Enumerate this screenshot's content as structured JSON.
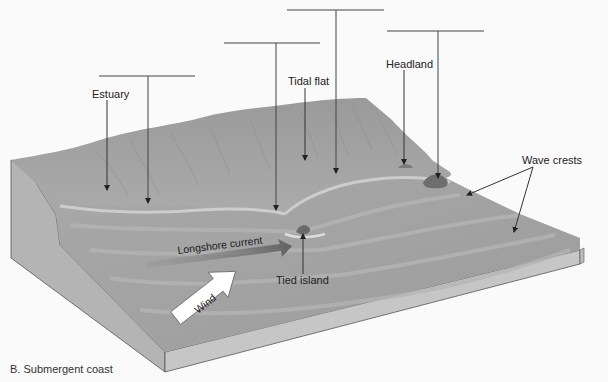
{
  "figure": {
    "caption": "B. Submergent coast"
  },
  "labels": {
    "estuary": "Estuary",
    "tidal_flat": "Tidal flat",
    "headland": "Headland",
    "wave_crests": "Wave crests",
    "tied_island": "Tied island",
    "longshore_current": "Longshore current",
    "wind": "Wind"
  },
  "blank_label_bars": [
    {
      "id": "bar-1",
      "x1": 99,
      "x2": 195,
      "y": 76,
      "stem_x": 148,
      "stem_end_y": 205
    },
    {
      "id": "bar-2",
      "x1": 224,
      "x2": 320,
      "y": 43,
      "stem_x": 276,
      "stem_end_y": 212
    },
    {
      "id": "bar-3",
      "x1": 287,
      "x2": 384,
      "y": 10,
      "stem_x": 336,
      "stem_end_y": 175
    },
    {
      "id": "bar-4",
      "x1": 387,
      "x2": 484,
      "y": 31,
      "stem_x": 438,
      "stem_end_y": 180
    }
  ],
  "colors": {
    "background": "#fafafa",
    "land": "#a6a6a6",
    "land_dark": "#8e8e8e",
    "water": "#9d9d9d",
    "water_light": "#b8b8b8",
    "block_side": "#c3c3c3",
    "block_edge": "#555555",
    "leader_line": "#333333",
    "current_arrow": "#6f6f6f",
    "wind_arrow": "#ffffff"
  }
}
